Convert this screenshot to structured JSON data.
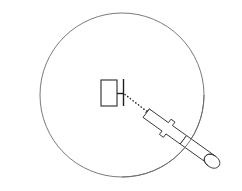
{
  "figure": {
    "background_color": "#ffffff",
    "width": 242,
    "height": 191
  },
  "elements": {
    "boundary_circle": {
      "label": "Field of view circle",
      "center_x": 122,
      "center_y": 95,
      "radius": 82,
      "stroke_color": "#6b6b6b",
      "stroke_width": 0.9,
      "fill": "none"
    },
    "specimen_rectangle": {
      "label": "Specimen rectangle",
      "x": 101,
      "y": 80,
      "width": 16,
      "height": 26,
      "stroke_color": "#2b2b2b",
      "stroke_width": 1.1,
      "fill": "#ffffff"
    },
    "blade_line": {
      "label": "Vertical blade line",
      "x": 123.5,
      "y_top": 79,
      "y_bottom": 106,
      "stroke_color": "#1f1f1f",
      "stroke_width": 1.4
    },
    "connector_tick": {
      "label": "Short horizontal connector tick",
      "x_start": 117,
      "x_end": 123.5,
      "y": 93.5,
      "stroke_color": "#1f1f1f",
      "stroke_width": 1.2
    },
    "beam_dotted_line": {
      "label": "Dotted beam path",
      "x_start": 124,
      "y_start": 94,
      "x_end": 147,
      "y_end": 112,
      "stroke_color": "#1f1f1f",
      "stroke_width": 1.5,
      "dash_pattern": "dotted"
    },
    "probe_tool": {
      "label": "Cylindrical probe tool",
      "tip_x": 147,
      "tip_y": 112,
      "end_x": 222,
      "end_y": 167,
      "stroke_color": "#3a3a3a",
      "stroke_width": 1,
      "fill": "#ffffff",
      "has_stepped_notches": true,
      "has_rounded_end_cap": true
    }
  },
  "accessibility": {
    "description": "Line art diagram: a large thin circle contains a small rectangle at center-left, a short vertical line to its right, and a dotted line running diagonally down-right to the tip of a long cylindrical probe tool that extends past the lower-right edge of the circle."
  }
}
